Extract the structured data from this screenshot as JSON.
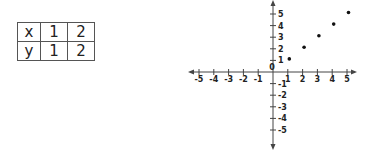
{
  "table": {
    "rows": [
      {
        "label": "x",
        "values": [
          "1",
          "2"
        ]
      },
      {
        "label": "y",
        "values": [
          "1",
          "2"
        ]
      }
    ]
  },
  "chart_data": {
    "type": "scatter",
    "title": "",
    "xlabel": "",
    "ylabel": "",
    "xlim": [
      -5,
      5
    ],
    "ylim": [
      -5,
      5
    ],
    "grid": false,
    "x_ticks": [
      "-5",
      "-4",
      "-3",
      "-2",
      "-1",
      "1",
      "2",
      "3",
      "4",
      "5"
    ],
    "y_ticks": [
      "5",
      "4",
      "3",
      "2",
      "1",
      "-1",
      "-2",
      "-3",
      "-4",
      "-5"
    ],
    "origin_label": "0",
    "points": [
      {
        "x": 1,
        "y": 1
      },
      {
        "x": 2,
        "y": 2
      },
      {
        "x": 3,
        "y": 3
      },
      {
        "x": 4,
        "y": 4
      },
      {
        "x": 5,
        "y": 5
      }
    ]
  }
}
